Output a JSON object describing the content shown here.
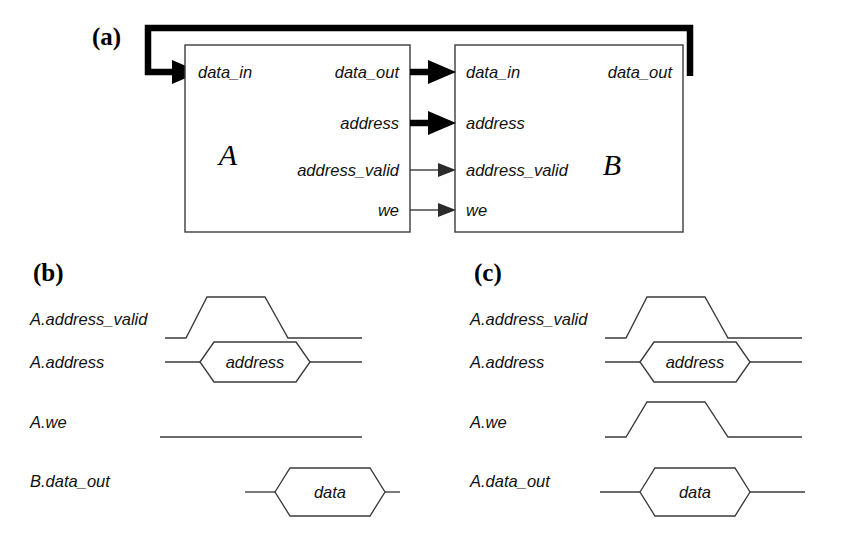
{
  "figure": {
    "panels": [
      {
        "id": "a",
        "letter": "(a)",
        "caption_x": 92,
        "caption_y": 45
      },
      {
        "id": "b",
        "letter": "(b)",
        "caption_x": 33,
        "caption_y": 281
      },
      {
        "id": "c",
        "letter": "(c)",
        "caption_x": 474,
        "caption_y": 281
      }
    ]
  },
  "block_diagram": {
    "blocks": [
      {
        "name": "A",
        "letter": "A",
        "x": 185,
        "y": 45,
        "w": 225,
        "h": 187,
        "letter_x": 228,
        "letter_y": 165,
        "inputs": [
          {
            "name": "data_in",
            "label": "data_in",
            "x": 198,
            "y": 78,
            "anchor": "start"
          }
        ],
        "outputs": [
          {
            "name": "data_out",
            "label": "data_out",
            "x": 399,
            "y": 78,
            "anchor": "end",
            "bus": true
          },
          {
            "name": "address",
            "label": "address",
            "x": 399,
            "y": 129,
            "anchor": "end",
            "bus": true
          },
          {
            "name": "address_valid",
            "label": "address_valid",
            "x": 399,
            "y": 176,
            "anchor": "end",
            "bus": false
          },
          {
            "name": "we",
            "label": "we",
            "x": 399,
            "y": 216,
            "anchor": "end",
            "bus": false
          }
        ]
      },
      {
        "name": "B",
        "letter": "B",
        "x": 455,
        "y": 45,
        "w": 228,
        "h": 187,
        "letter_x": 612,
        "letter_y": 175,
        "inputs": [
          {
            "name": "data_in",
            "label": "data_in",
            "x": 466,
            "y": 78,
            "anchor": "start"
          },
          {
            "name": "address",
            "label": "address",
            "x": 466,
            "y": 129,
            "anchor": "start"
          },
          {
            "name": "address_valid",
            "label": "address_valid",
            "x": 466,
            "y": 176,
            "anchor": "start"
          },
          {
            "name": "we",
            "label": "we",
            "x": 466,
            "y": 216,
            "anchor": "start"
          }
        ],
        "outputs": [
          {
            "name": "data_out",
            "label": "data_out",
            "x": 672,
            "y": 78,
            "anchor": "end",
            "bus": true
          }
        ]
      }
    ],
    "connections": [
      {
        "from": "A.data_out",
        "to": "B.data_in",
        "type": "bus",
        "y": 72
      },
      {
        "from": "A.address",
        "to": "B.address",
        "type": "bus",
        "y": 123
      },
      {
        "from": "A.address_valid",
        "to": "B.address_valid",
        "type": "control",
        "y": 170
      },
      {
        "from": "A.we",
        "to": "B.we",
        "type": "control",
        "y": 210
      },
      {
        "from": "B.data_out",
        "to": "A.data_in",
        "type": "feedback-bus",
        "top_y": 28
      }
    ]
  },
  "timing_panels": [
    {
      "id": "b",
      "description": "read transaction",
      "signals": [
        {
          "name": "A.address_valid",
          "label": "A.address_valid",
          "kind": "pulse",
          "value": null
        },
        {
          "name": "A.address",
          "label": "A.address",
          "kind": "bus",
          "value": "address"
        },
        {
          "name": "A.we",
          "label": "A.we",
          "kind": "low",
          "value": null
        },
        {
          "name": "B.data_out",
          "label": "B.data_out",
          "kind": "bus",
          "value": "data"
        }
      ]
    },
    {
      "id": "c",
      "description": "write transaction",
      "signals": [
        {
          "name": "A.address_valid",
          "label": "A.address_valid",
          "kind": "pulse",
          "value": null
        },
        {
          "name": "A.address",
          "label": "A.address",
          "kind": "bus",
          "value": "address"
        },
        {
          "name": "A.we",
          "label": "A.we",
          "kind": "pulse",
          "value": null
        },
        {
          "name": "A.data_out",
          "label": "A.data_out",
          "kind": "bus",
          "value": "data"
        }
      ]
    }
  ],
  "colors": {
    "line": "#3a3a3a",
    "bold_line": "#000000",
    "text": "#111111",
    "background": "#ffffff"
  }
}
